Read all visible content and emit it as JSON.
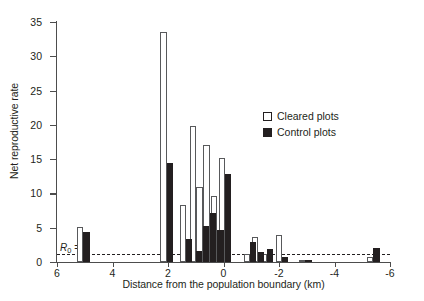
{
  "chart": {
    "type": "bar",
    "title": "",
    "xlabel": "Distance from the population boundary (km)",
    "ylabel": "Net reproductive rate",
    "yticks": [
      "0",
      "5",
      "10",
      "15",
      "20",
      "25",
      "30",
      "35"
    ],
    "xticks": [
      "6",
      "4",
      "2",
      "0",
      "-2",
      "-4",
      "-6"
    ],
    "annotation": {
      "r0_prefix": "R",
      "r0_sub": "0",
      "r0_suffix": " =1",
      "r0_value": 1
    },
    "legend": {
      "position": "top-right",
      "items": [
        {
          "label": "Cleared plots",
          "swatch": "open-square"
        },
        {
          "label": "Control plots",
          "swatch": "filled-square"
        }
      ]
    }
  },
  "chart_data": {
    "type": "bar",
    "title": "",
    "xlabel": "Distance from the population boundary (km)",
    "ylabel": "Net reproductive rate",
    "xlim": [
      6,
      -6
    ],
    "ylim": [
      0,
      35
    ],
    "xticks": [
      6,
      4,
      2,
      0,
      -2,
      -4,
      -6
    ],
    "yticks": [
      0,
      5,
      10,
      15,
      20,
      25,
      30,
      35
    ],
    "grid": false,
    "x_axis_reversed": true,
    "reference_line": {
      "label": "R0 = 1",
      "y": 1,
      "style": "dashed"
    },
    "series": [
      {
        "name": "Cleared plots",
        "color": "#ffffff",
        "edgecolor": "#58595b"
      },
      {
        "name": "Control plots",
        "color": "#231f20",
        "edgecolor": "#231f20"
      }
    ],
    "points": [
      {
        "x": 5.05,
        "cleared": 5.1,
        "control": 4.4
      },
      {
        "x": 2.05,
        "cleared": 33.5,
        "control": 14.5
      },
      {
        "x": 1.35,
        "cleared": 8.3,
        "control": 3.4
      },
      {
        "x": 1.0,
        "cleared": 19.9,
        "control": 1.6
      },
      {
        "x": 0.75,
        "cleared": 11.0,
        "control": 5.3
      },
      {
        "x": 0.5,
        "cleared": 17.1,
        "control": 7.2
      },
      {
        "x": 0.22,
        "cleared": 9.7,
        "control": 4.6
      },
      {
        "x": -0.05,
        "cleared": 15.1,
        "control": 12.8
      },
      {
        "x": -0.95,
        "cleared": 1.1,
        "control": 2.9
      },
      {
        "x": -1.25,
        "cleared": 3.6,
        "control": 1.5
      },
      {
        "x": -1.55,
        "cleared": 1.2,
        "control": 1.9
      },
      {
        "x": -2.1,
        "cleared": 4.0,
        "control": 0.7
      },
      {
        "x": -2.95,
        "cleared": 0.35,
        "control": 0.35
      },
      {
        "x": -5.4,
        "cleared": 0.8,
        "control": 2.1
      }
    ]
  }
}
